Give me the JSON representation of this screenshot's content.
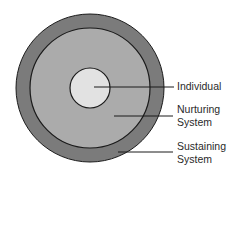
{
  "diagram": {
    "type": "concentric-circles",
    "colors": {
      "outer_ring": "#7b7b7b",
      "middle_ring": "#ababab",
      "core": "#e2e2e2",
      "stroke": "#1a1a1a",
      "text": "#2a2a2a"
    },
    "layers": [
      {
        "id": "individual",
        "lines": [
          "Individual"
        ]
      },
      {
        "id": "nurturing",
        "lines": [
          "Nurturing",
          "System"
        ]
      },
      {
        "id": "sustaining",
        "lines": [
          "Sustaining",
          "System"
        ]
      }
    ]
  }
}
